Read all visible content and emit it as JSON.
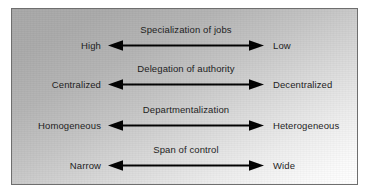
{
  "diagram": {
    "frame": {
      "border_color": "#6e6e6e",
      "background_start": "#a8a8a8",
      "background_end": "#ffffff"
    },
    "text_color": "#1b1b1b",
    "arrow_color": "#000000",
    "rows": [
      {
        "left_label": "High",
        "dimension": "Specialization of jobs",
        "right_label": "Low"
      },
      {
        "left_label": "Centralized",
        "dimension": "Delegation of authority",
        "right_label": "Decentralized"
      },
      {
        "left_label": "Homogeneous",
        "dimension": "Departmentalization",
        "right_label": "Heterogeneous"
      },
      {
        "left_label": "Narrow",
        "dimension": "Span of control",
        "right_label": "Wide"
      }
    ]
  }
}
